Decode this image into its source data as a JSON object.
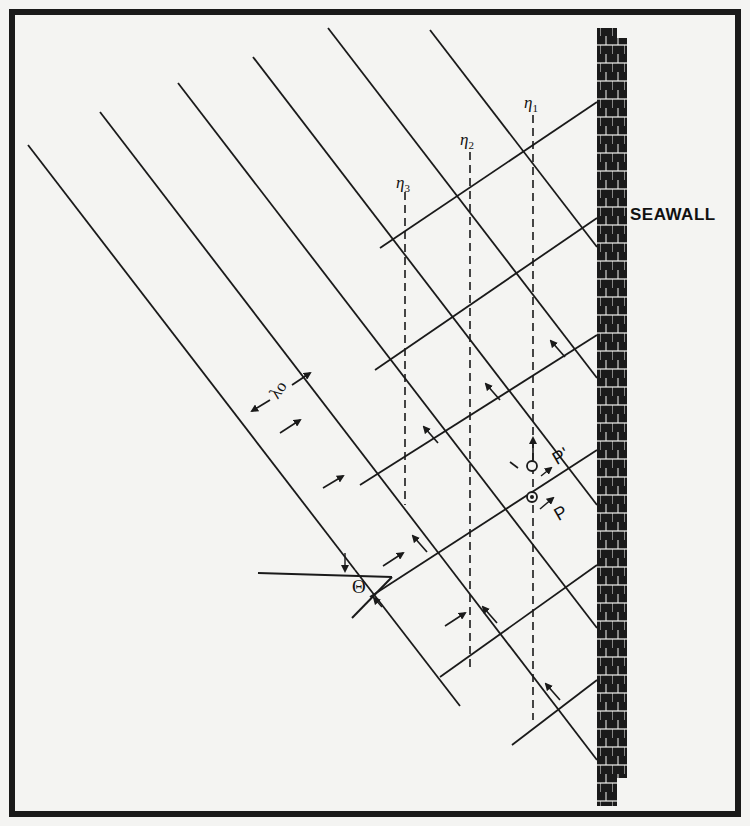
{
  "figure": {
    "type": "wave reflection at seawall diagram",
    "border_color": "#1a1a1a",
    "line_color": "#1a1a1a",
    "background": "#f4f4f2"
  },
  "labels": {
    "seawall": "SEAWALL",
    "eta1": {
      "base": "η",
      "sub": "1"
    },
    "eta2": {
      "base": "η",
      "sub": "2"
    },
    "eta3": {
      "base": "η",
      "sub": "3"
    },
    "wavelength": "λo",
    "angle": "Θ",
    "point_p": "P",
    "point_p_prime": "P'"
  },
  "geometry": {
    "wall_x": 597,
    "incident_lines": [
      {
        "x1": 28,
        "y1": 145,
        "x2": 355,
        "y2": 570
      },
      {
        "x1": 100,
        "y1": 112,
        "x2": 440,
        "y2": 555
      },
      {
        "x1": 178,
        "y1": 83,
        "x2": 597,
        "y2": 628
      },
      {
        "x1": 253,
        "y1": 57,
        "x2": 597,
        "y2": 505
      },
      {
        "x1": 328,
        "y1": 28,
        "x2": 597,
        "y2": 378
      },
      {
        "x1": 430,
        "y1": 30,
        "x2": 597,
        "y2": 247
      }
    ],
    "incident_lower_lines": [
      {
        "x1": 440,
        "y1": 555,
        "x2": 597,
        "y2": 760
      },
      {
        "x1": 355,
        "y1": 570,
        "x2": 460,
        "y2": 706
      }
    ],
    "reflected_lines": [
      {
        "x1": 380,
        "y1": 248,
        "x2": 597,
        "y2": 102
      },
      {
        "x1": 375,
        "y1": 370,
        "x2": 597,
        "y2": 218
      },
      {
        "x1": 360,
        "y1": 485,
        "x2": 597,
        "y2": 335
      },
      {
        "x1": 370,
        "y1": 597,
        "x2": 597,
        "y2": 450
      },
      {
        "x1": 440,
        "y1": 677,
        "x2": 597,
        "y2": 565
      },
      {
        "x1": 512,
        "y1": 745,
        "x2": 597,
        "y2": 680
      }
    ],
    "eta_lines": [
      {
        "name": "eta1",
        "x": 533,
        "y1": 115,
        "y2": 720
      },
      {
        "name": "eta2",
        "x": 470,
        "y1": 152,
        "y2": 672
      },
      {
        "name": "eta3",
        "x": 405,
        "y1": 192,
        "y2": 505
      }
    ]
  }
}
